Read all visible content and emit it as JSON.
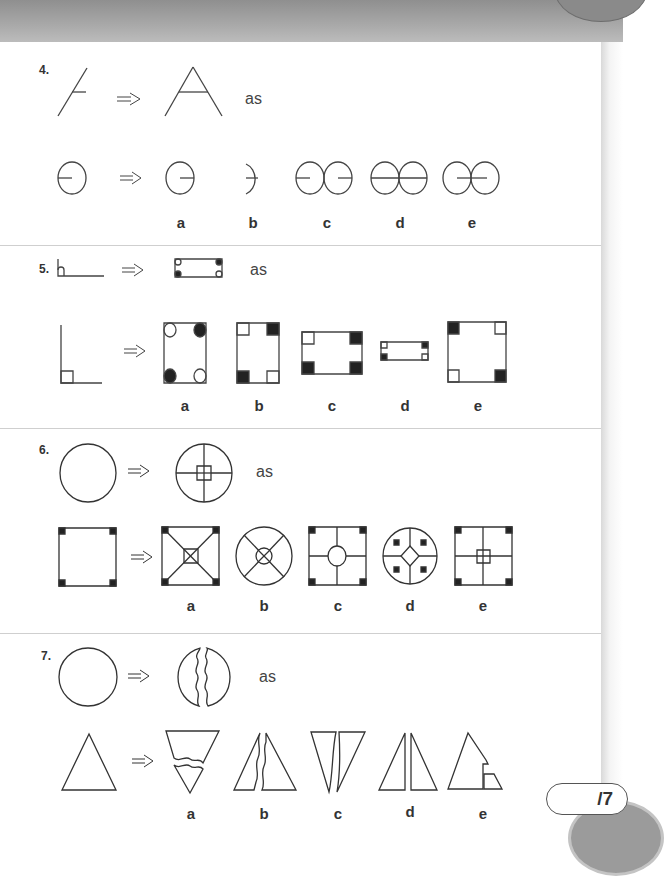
{
  "questions": [
    {
      "number": "4.",
      "example_connector": "as",
      "description": "Line with tick becomes letter A shape; circle with radius line",
      "options": [
        "a",
        "b",
        "c",
        "d",
        "e"
      ]
    },
    {
      "number": "5.",
      "example_connector": "as",
      "description": "Right-angle corner becomes rectangle with corner markers",
      "options": [
        "a",
        "b",
        "c",
        "d",
        "e"
      ]
    },
    {
      "number": "6.",
      "example_connector": "as",
      "description": "Circle becomes circle with cross and center square",
      "options": [
        "a",
        "b",
        "c",
        "d",
        "e"
      ]
    },
    {
      "number": "7.",
      "example_connector": "as",
      "description": "Circle becomes circle split by wavy line",
      "options": [
        "a",
        "b",
        "c",
        "d",
        "e"
      ]
    }
  ],
  "score": {
    "label": "/7"
  },
  "colors": {
    "ink": "#333333",
    "fill": "#222222",
    "divider": "#cfcfcf",
    "band": "#a0a0a0"
  }
}
